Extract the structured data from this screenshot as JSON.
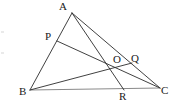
{
  "figure": {
    "background_color": "#ffffff",
    "stroke_color": "#2b2b2b",
    "baseline_color": "#8a8a8a",
    "label_color": "#1a1a1a",
    "width": 176,
    "height": 112
  },
  "points": {
    "A": {
      "label": "A",
      "x": 72,
      "y": 13,
      "label_x": 59,
      "label_y": 1
    },
    "B": {
      "label": "B",
      "x": 30,
      "y": 90,
      "label_x": 19,
      "label_y": 86
    },
    "C": {
      "label": "C",
      "x": 160,
      "y": 88,
      "label_x": 161,
      "label_y": 85
    },
    "P": {
      "label": "P",
      "x": 57,
      "y": 41,
      "label_x": 45,
      "label_y": 31
    },
    "Q": {
      "label": "Q",
      "x": 132,
      "y": 63,
      "label_x": 131,
      "label_y": 53
    },
    "R": {
      "label": "R",
      "x": 124,
      "y": 90,
      "label_x": 119,
      "label_y": 91
    },
    "O": {
      "label": "O",
      "x": 118,
      "y": 68,
      "label_x": 113,
      "label_y": 54
    }
  },
  "segments": [
    {
      "name": "side-AB",
      "from": "A",
      "to": "B",
      "kind": "side"
    },
    {
      "name": "side-BC",
      "from": "B",
      "to": "C",
      "kind": "baseline"
    },
    {
      "name": "side-AC",
      "from": "A",
      "to": "C",
      "kind": "side"
    },
    {
      "name": "cevian-AR",
      "from": "A",
      "to": "R",
      "kind": "cevian"
    },
    {
      "name": "cevian-BQ",
      "from": "B",
      "to": "Q",
      "kind": "cevian"
    },
    {
      "name": "cevian-PC",
      "from": "P",
      "to": "C",
      "kind": "cevian"
    }
  ],
  "notes": {
    "concurrency_point": "O",
    "on_AB": "P",
    "on_AC": "Q",
    "on_BC": "R"
  }
}
